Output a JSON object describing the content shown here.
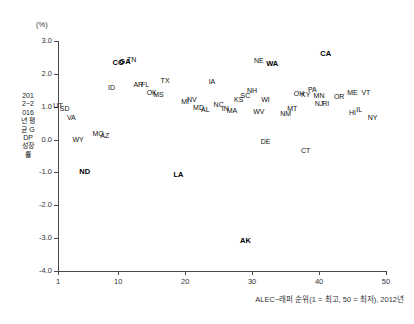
{
  "chart_data": {
    "type": "scatter",
    "title": "",
    "unit_label": "(%)",
    "xlabel": "ALEC−래퍼 순위(1 = 최고, 50 = 최저), 2012년",
    "ylabel": "2012~2016년 평균 GDP 성장률",
    "xlim": [
      1,
      50
    ],
    "ylim": [
      -4.0,
      3.0
    ],
    "grid": false,
    "legend": false,
    "xticks": [
      {
        "value": 1,
        "label": "1"
      },
      {
        "value": 10,
        "label": "10"
      },
      {
        "value": 20,
        "label": "20"
      },
      {
        "value": 30,
        "label": "30"
      },
      {
        "value": 40,
        "label": "40"
      },
      {
        "value": 50,
        "label": "50"
      }
    ],
    "yticks": [
      {
        "value": 3.0,
        "label": "3.0"
      },
      {
        "value": 2.0,
        "label": "2.0"
      },
      {
        "value": 1.0,
        "label": "1.0"
      },
      {
        "value": 0.0,
        "label": "0.0"
      },
      {
        "value": -1.0,
        "label": "-1.0"
      },
      {
        "value": -2.0,
        "label": "-2.0"
      },
      {
        "value": -3.0,
        "label": "-3.0"
      },
      {
        "value": -4.0,
        "label": "-4.0"
      }
    ],
    "point_labels": [
      "state abbreviation"
    ],
    "points": [
      {
        "label": "UT",
        "x": 1,
        "y": 1.05,
        "bold": false
      },
      {
        "label": "SD",
        "x": 2,
        "y": 0.95,
        "bold": false
      },
      {
        "label": "VA",
        "x": 3,
        "y": 0.7,
        "bold": false
      },
      {
        "label": "WY",
        "x": 4,
        "y": 0.02,
        "bold": false
      },
      {
        "label": "ND",
        "x": 5,
        "y": -0.95,
        "bold": true
      },
      {
        "label": "MO",
        "x": 7,
        "y": 0.2,
        "bold": false
      },
      {
        "label": "AZ",
        "x": 8,
        "y": 0.15,
        "bold": false
      },
      {
        "label": "ID",
        "x": 9,
        "y": 1.6,
        "bold": false
      },
      {
        "label": "CO",
        "x": 10,
        "y": 2.35,
        "bold": true
      },
      {
        "label": "GA",
        "x": 11,
        "y": 2.4,
        "bold": true
      },
      {
        "label": "TN",
        "x": 12,
        "y": 2.45,
        "bold": false
      },
      {
        "label": "AR",
        "x": 13,
        "y": 1.7,
        "bold": false
      },
      {
        "label": "FL",
        "x": 14,
        "y": 1.7,
        "bold": false
      },
      {
        "label": "OK",
        "x": 15,
        "y": 1.45,
        "bold": false
      },
      {
        "label": "MS",
        "x": 16,
        "y": 1.38,
        "bold": false
      },
      {
        "label": "TX",
        "x": 17,
        "y": 1.8,
        "bold": false
      },
      {
        "label": "LA",
        "x": 19,
        "y": -1.05,
        "bold": true
      },
      {
        "label": "MI",
        "x": 20,
        "y": 1.18,
        "bold": false
      },
      {
        "label": "NV",
        "x": 21,
        "y": 1.25,
        "bold": false
      },
      {
        "label": "MD",
        "x": 22,
        "y": 1.0,
        "bold": false
      },
      {
        "label": "AL",
        "x": 23,
        "y": 0.92,
        "bold": false
      },
      {
        "label": "IA",
        "x": 24,
        "y": 1.78,
        "bold": false
      },
      {
        "label": "NC",
        "x": 25,
        "y": 1.08,
        "bold": false
      },
      {
        "label": "IN",
        "x": 26,
        "y": 0.95,
        "bold": false
      },
      {
        "label": "MA",
        "x": 27,
        "y": 0.9,
        "bold": false
      },
      {
        "label": "KS",
        "x": 28,
        "y": 1.22,
        "bold": false
      },
      {
        "label": "SC",
        "x": 29,
        "y": 1.35,
        "bold": false
      },
      {
        "label": "NH",
        "x": 30,
        "y": 1.52,
        "bold": false
      },
      {
        "label": "AK",
        "x": 29,
        "y": -3.05,
        "bold": true
      },
      {
        "label": "NE",
        "x": 31,
        "y": 2.42,
        "bold": false
      },
      {
        "label": "WA",
        "x": 33,
        "y": 2.32,
        "bold": true
      },
      {
        "label": "WI",
        "x": 32,
        "y": 1.22,
        "bold": false
      },
      {
        "label": "WV",
        "x": 31,
        "y": 0.88,
        "bold": false
      },
      {
        "label": "DE",
        "x": 32,
        "y": -0.05,
        "bold": false
      },
      {
        "label": "NM",
        "x": 35,
        "y": 0.82,
        "bold": false
      },
      {
        "label": "MT",
        "x": 36,
        "y": 0.95,
        "bold": false
      },
      {
        "label": "OH",
        "x": 37,
        "y": 1.42,
        "bold": false
      },
      {
        "label": "KY",
        "x": 38,
        "y": 1.4,
        "bold": false
      },
      {
        "label": "PA",
        "x": 39,
        "y": 1.55,
        "bold": false
      },
      {
        "label": "MN",
        "x": 40,
        "y": 1.35,
        "bold": false
      },
      {
        "label": "NJ",
        "x": 40,
        "y": 1.12,
        "bold": false
      },
      {
        "label": "RI",
        "x": 41,
        "y": 1.1,
        "bold": false
      },
      {
        "label": "CA",
        "x": 41,
        "y": 2.62,
        "bold": true
      },
      {
        "label": "OR",
        "x": 43,
        "y": 1.32,
        "bold": false
      },
      {
        "label": "ME",
        "x": 45,
        "y": 1.45,
        "bold": false
      },
      {
        "label": "VT",
        "x": 47,
        "y": 1.45,
        "bold": false
      },
      {
        "label": "HI",
        "x": 45,
        "y": 0.85,
        "bold": false
      },
      {
        "label": "IL",
        "x": 46,
        "y": 0.92,
        "bold": false
      },
      {
        "label": "NY",
        "x": 48,
        "y": 0.68,
        "bold": false
      },
      {
        "label": "CT",
        "x": 38,
        "y": -0.32,
        "bold": false
      }
    ]
  }
}
